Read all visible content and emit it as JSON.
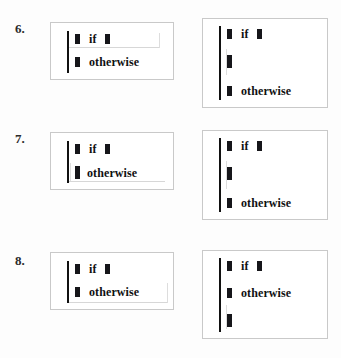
{
  "page": {
    "background_color": "#fdfdfd",
    "box_border_color": "#c9c9c9",
    "ink_color": "#111111",
    "artifact_color": "#d7d7d7"
  },
  "keywords": {
    "if": "if",
    "otherwise": "otherwise"
  },
  "problems": [
    {
      "number": "6.",
      "left_box": {
        "cases": [
          {
            "keyword": "if",
            "has_leading_token": true,
            "has_trailing_token": true
          },
          {
            "keyword": "otherwise",
            "has_leading_token": true,
            "has_trailing_token": false
          }
        ]
      },
      "right_box": {
        "cases": [
          {
            "keyword": "if",
            "has_leading_token": true,
            "has_trailing_token": true
          },
          {
            "keyword": "",
            "has_leading_token": true,
            "has_trailing_token": false
          },
          {
            "keyword": "otherwise",
            "has_leading_token": true,
            "has_trailing_token": false
          }
        ]
      }
    },
    {
      "number": "7.",
      "left_box": {
        "cases": [
          {
            "keyword": "if",
            "has_leading_token": true,
            "has_trailing_token": true
          },
          {
            "keyword": "otherwise",
            "has_leading_token": true,
            "has_trailing_token": false
          }
        ]
      },
      "right_box": {
        "cases": [
          {
            "keyword": "if",
            "has_leading_token": true,
            "has_trailing_token": true
          },
          {
            "keyword": "",
            "has_leading_token": true,
            "has_trailing_token": false
          },
          {
            "keyword": "otherwise",
            "has_leading_token": true,
            "has_trailing_token": false
          }
        ]
      }
    },
    {
      "number": "8.",
      "left_box": {
        "cases": [
          {
            "keyword": "if",
            "has_leading_token": true,
            "has_trailing_token": true
          },
          {
            "keyword": "otherwise",
            "has_leading_token": true,
            "has_trailing_token": false
          }
        ]
      },
      "right_box": {
        "cases": [
          {
            "keyword": "if",
            "has_leading_token": true,
            "has_trailing_token": true
          },
          {
            "keyword": "otherwise",
            "has_leading_token": true,
            "has_trailing_token": false
          },
          {
            "keyword": "",
            "has_leading_token": true,
            "has_trailing_token": false
          }
        ]
      }
    }
  ]
}
